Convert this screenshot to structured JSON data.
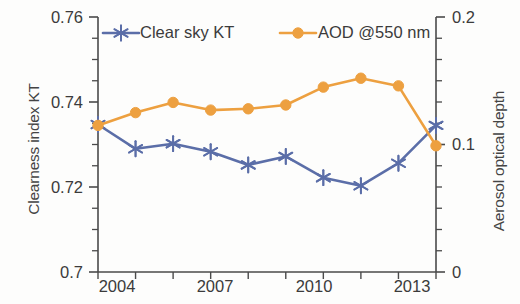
{
  "chart_data": {
    "type": "line",
    "title": "",
    "xlabel": "",
    "x": [
      2004,
      2005,
      2006,
      2007,
      2008,
      2009,
      2010,
      2011,
      2012,
      2013
    ],
    "x_tick_labels": [
      "2004",
      "2007",
      "2010",
      "2013"
    ],
    "x_tick_values": [
      2004,
      2007,
      2010,
      2013
    ],
    "xlim": [
      2004,
      2013
    ],
    "grid": false,
    "legend_position": "top-inside",
    "series": [
      {
        "name": "Clear sky KT",
        "axis": "left",
        "color": "#5b6ea8",
        "marker": "asterisk",
        "values": [
          0.7347,
          0.729,
          0.7302,
          0.7283,
          0.7252,
          0.7272,
          0.7222,
          0.7203,
          0.7256,
          0.7345
        ]
      },
      {
        "name": "AOD @550 nm",
        "axis": "right",
        "color": "#eda040",
        "marker": "circle",
        "values": [
          0.115,
          0.125,
          0.133,
          0.127,
          0.128,
          0.131,
          0.145,
          0.152,
          0.146,
          0.099
        ]
      }
    ],
    "axes": {
      "left": {
        "label": "Clearness index KT",
        "ylim": [
          0.7,
          0.76
        ],
        "tick_labels": [
          "0.76",
          "0.74",
          "0.72",
          "0.7"
        ],
        "tick_values": [
          0.76,
          0.74,
          0.72,
          0.7
        ],
        "minor_tick_step": 0.005
      },
      "right": {
        "label": "Aerosol optical depth",
        "ylim": [
          0,
          0.2
        ],
        "tick_labels": [
          "0.2",
          "0.1",
          "0"
        ],
        "tick_values": [
          0.2,
          0.1,
          0
        ],
        "minor_tick_step": 0.0167
      }
    }
  },
  "legend": {
    "items": [
      {
        "label": "Clear sky KT",
        "color": "#5b6ea8"
      },
      {
        "label": "AOD @550 nm",
        "color": "#eda040"
      }
    ]
  },
  "ticks": {
    "left": {
      "t0": "0.76",
      "t1": "0.74",
      "t2": "0.72",
      "t3": "0.7"
    },
    "right": {
      "t0": "0.2",
      "t1": "0.1",
      "t2": "0"
    },
    "x": {
      "t0": "2004",
      "t1": "2007",
      "t2": "2010",
      "t3": "2013"
    }
  },
  "titles": {
    "left_axis": "Clearness index KT",
    "right_axis": "Aerosol optical depth"
  }
}
